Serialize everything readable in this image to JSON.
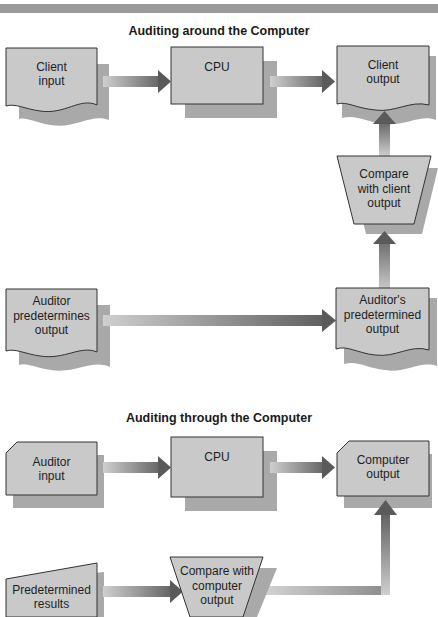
{
  "header": {
    "fragment": "Figure 3-7 Auditing"
  },
  "diagrams": [
    {
      "title": "Auditing around the Computer",
      "nodes": {
        "client_input": "Client\ninput",
        "cpu": "CPU",
        "client_output": "Client\noutput",
        "compare": "Compare\nwith client\noutput",
        "auditor_predetermines": "Auditor\npredetermines\noutput",
        "auditors_predetermined": "Auditor's\npredetermined\noutput"
      }
    },
    {
      "title": "Auditing through the Computer",
      "nodes": {
        "auditor_input": "Auditor\ninput",
        "cpu": "CPU",
        "computer_output": "Computer\noutput",
        "predetermined_results": "Predetermined\nresults",
        "compare": "Compare with\ncomputer\noutput"
      }
    }
  ],
  "colors": {
    "box_fill": "#c8c8c8",
    "shadow": "#a8a8a8",
    "arrow_dark": "#5a5a5a",
    "arrow_light": "#c4c4c4",
    "header_bar": "#9a9a9a"
  }
}
